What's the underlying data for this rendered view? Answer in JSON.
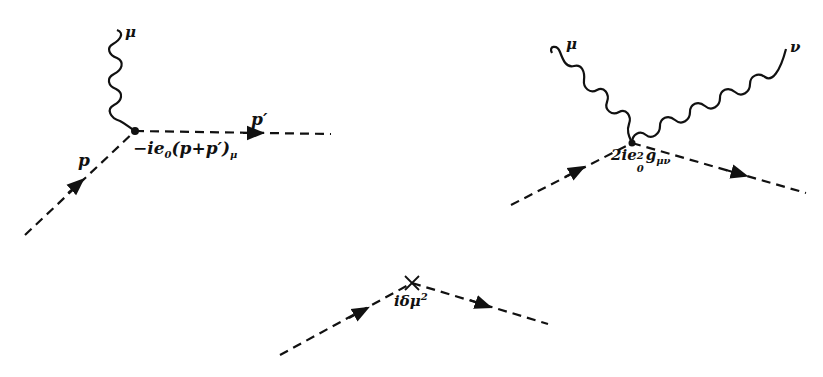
{
  "colors": {
    "ink": "#111111",
    "background": "#ffffff"
  },
  "diagrams": [
    {
      "id": "three-point-vertex",
      "lines": [
        "photon (wavy) labelled mu",
        "incoming scalar (dashed) momentum p",
        "outgoing scalar (dashed) momentum p'"
      ],
      "labels": {
        "photon_index": "μ",
        "incoming_momentum": "p",
        "outgoing_momentum": "p′",
        "vertex_factor_main": "−ie",
        "vertex_factor_sub": "0",
        "vertex_factor_rest": "(p+p′)",
        "vertex_factor_index": "μ"
      }
    },
    {
      "id": "seagull-vertex",
      "lines": [
        "photon (wavy) labelled mu",
        "photon (wavy) labelled nu",
        "incoming scalar (dashed)",
        "outgoing scalar (dashed)"
      ],
      "labels": {
        "photon1_index": "μ",
        "photon2_index": "ν",
        "vertex_factor_main": "2ie",
        "vertex_factor_sub": "0",
        "vertex_factor_sup": "2",
        "vertex_factor_g": "g",
        "vertex_factor_index": "μν"
      }
    },
    {
      "id": "mass-counterterm",
      "lines": [
        "incoming scalar (dashed)",
        "outgoing scalar (dashed)"
      ],
      "labels": {
        "vertex_factor_main": "iδμ",
        "vertex_factor_sup": "2"
      }
    }
  ]
}
